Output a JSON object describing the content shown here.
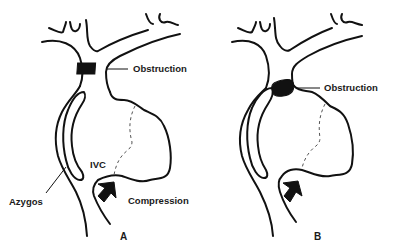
{
  "figure": {
    "panels": [
      {
        "id": "A",
        "label": "A",
        "annotations": {
          "obstruction": "Obstruction",
          "ivc": "IVC",
          "azygos": "Azygos",
          "compression": "Compression"
        }
      },
      {
        "id": "B",
        "label": "B",
        "annotations": {
          "obstruction": "Obstruction"
        }
      }
    ],
    "colors": {
      "line": "#111111",
      "dashed": "#555555",
      "background": "#ffffff"
    }
  }
}
